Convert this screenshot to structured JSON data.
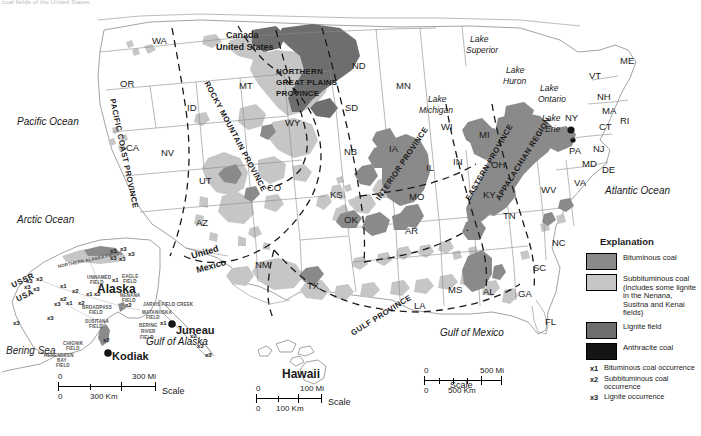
{
  "caption": "coal fields of the United States.",
  "colors": {
    "bituminous": "#8a8a8a",
    "subbituminous": "#c6c6c6",
    "lignite": "#6e6e6e",
    "anthracite": "#151515",
    "outline": "#707070",
    "province_dash": "#1a1a1a"
  },
  "legend": {
    "title": "Explanation",
    "swatches": [
      {
        "label": "Bituminous coal",
        "color": "#8a8a8a"
      },
      {
        "label": "Subbituminous coal (includes some lignite in the Nenana, Susitna and Kenai fields)",
        "color": "#c6c6c6"
      },
      {
        "label": "Lignite field",
        "color": "#6e6e6e"
      },
      {
        "label": "Anthracite coal",
        "color": "#151515"
      }
    ],
    "occurrences": [
      {
        "key": "x1",
        "label": "Bituminous coal occurrence"
      },
      {
        "key": "x2",
        "label": "Subbituminous coal occurrence"
      },
      {
        "key": "x3",
        "label": "Lignite occurrence"
      }
    ]
  },
  "provinces": [
    "PACIFIC COAST PROVINCE",
    "ROCKY MOUNTAIN PROVINCE",
    "NORTHERN GREAT PLAINS PROVINCE",
    "INTERIOR PROVINCE",
    "EASTERN PROVINCE",
    "APPALACHIAN REGION",
    "GULF PROVINCE"
  ],
  "province_labels": {
    "pacific_coast": "PACIFIC COAST PROVINCE",
    "rocky_mountain": "ROCKY MOUNTAIN PROVINCE",
    "northern_great_plains_1": "NORTHERN",
    "northern_great_plains_2": "GREAT PLAINS",
    "northern_great_plains_3": "PROVINCE",
    "interior": "INTERIOR PROVINCE",
    "eastern": "EASTERN PROVINCE",
    "appalachian": "APPALACHIAN REGION",
    "gulf": "GULF PROVINCE"
  },
  "states": [
    {
      "abbr": "WA",
      "x": 152,
      "y": 36
    },
    {
      "abbr": "OR",
      "x": 120,
      "y": 79
    },
    {
      "abbr": "ID",
      "x": 187,
      "y": 103
    },
    {
      "abbr": "MT",
      "x": 239,
      "y": 81
    },
    {
      "abbr": "ND",
      "x": 352,
      "y": 61
    },
    {
      "abbr": "SD",
      "x": 345,
      "y": 103
    },
    {
      "abbr": "MN",
      "x": 396,
      "y": 81
    },
    {
      "abbr": "WI",
      "x": 441,
      "y": 122
    },
    {
      "abbr": "MI",
      "x": 479,
      "y": 130
    },
    {
      "abbr": "NV",
      "x": 161,
      "y": 148
    },
    {
      "abbr": "CA",
      "x": 126,
      "y": 143
    },
    {
      "abbr": "UT",
      "x": 199,
      "y": 176
    },
    {
      "abbr": "WY",
      "x": 285,
      "y": 118
    },
    {
      "abbr": "CO",
      "x": 267,
      "y": 183
    },
    {
      "abbr": "NB",
      "x": 344,
      "y": 147
    },
    {
      "abbr": "KS",
      "x": 330,
      "y": 190
    },
    {
      "abbr": "IA",
      "x": 389,
      "y": 144
    },
    {
      "abbr": "IL",
      "x": 426,
      "y": 163
    },
    {
      "abbr": "MO",
      "x": 409,
      "y": 192
    },
    {
      "abbr": "IN",
      "x": 453,
      "y": 157
    },
    {
      "abbr": "OH",
      "x": 491,
      "y": 160
    },
    {
      "abbr": "KY",
      "x": 483,
      "y": 190
    },
    {
      "abbr": "TN",
      "x": 503,
      "y": 211
    },
    {
      "abbr": "AZ",
      "x": 196,
      "y": 218
    },
    {
      "abbr": "NM",
      "x": 255,
      "y": 260
    },
    {
      "abbr": "OK",
      "x": 344,
      "y": 215
    },
    {
      "abbr": "TX",
      "x": 307,
      "y": 281
    },
    {
      "abbr": "AR",
      "x": 405,
      "y": 226
    },
    {
      "abbr": "MS",
      "x": 448,
      "y": 285
    },
    {
      "abbr": "LA",
      "x": 414,
      "y": 301
    },
    {
      "abbr": "AL",
      "x": 483,
      "y": 287
    },
    {
      "abbr": "GA",
      "x": 518,
      "y": 289
    },
    {
      "abbr": "FL",
      "x": 545,
      "y": 317
    },
    {
      "abbr": "SC",
      "x": 533,
      "y": 263
    },
    {
      "abbr": "NC",
      "x": 552,
      "y": 238
    },
    {
      "abbr": "VA",
      "x": 574,
      "y": 178
    },
    {
      "abbr": "WV",
      "x": 541,
      "y": 185
    },
    {
      "abbr": "MD",
      "x": 582,
      "y": 159
    },
    {
      "abbr": "DE",
      "x": 602,
      "y": 165
    },
    {
      "abbr": "NJ",
      "x": 593,
      "y": 144
    },
    {
      "abbr": "PA",
      "x": 569,
      "y": 146
    },
    {
      "abbr": "NY",
      "x": 565,
      "y": 113
    },
    {
      "abbr": "CT",
      "x": 599,
      "y": 122
    },
    {
      "abbr": "RI",
      "x": 620,
      "y": 116
    },
    {
      "abbr": "MA",
      "x": 602,
      "y": 106
    },
    {
      "abbr": "NH",
      "x": 597,
      "y": 92
    },
    {
      "abbr": "VT",
      "x": 589,
      "y": 71
    },
    {
      "abbr": "ME",
      "x": 620,
      "y": 56
    }
  ],
  "oceans": [
    {
      "name": "Pacific Ocean",
      "x": 17,
      "y": 117
    },
    {
      "name": "Atlantic Ocean",
      "x": 605,
      "y": 186
    },
    {
      "name": "Arctic Ocean",
      "x": 17,
      "y": 215
    },
    {
      "name": "Gulf of Mexico",
      "x": 440,
      "y": 328
    },
    {
      "name": "Gulf of Alaska",
      "x": 146,
      "y": 337
    },
    {
      "name": "Bering Sea",
      "x": 6,
      "y": 346
    }
  ],
  "lakes": [
    {
      "name": "Lake",
      "x": 470,
      "y": 35
    },
    {
      "name": "Superior",
      "x": 466,
      "y": 46
    },
    {
      "name": "Lake",
      "x": 506,
      "y": 66
    },
    {
      "name": "Huron",
      "x": 503,
      "y": 77
    },
    {
      "name": "Lake",
      "x": 428,
      "y": 95
    },
    {
      "name": "Michigan",
      "x": 419,
      "y": 106
    },
    {
      "name": "Lake",
      "x": 540,
      "y": 84
    },
    {
      "name": "Ontario",
      "x": 538,
      "y": 95
    },
    {
      "name": "Lake",
      "x": 542,
      "y": 114
    },
    {
      "name": "Erie",
      "x": 545,
      "y": 125
    }
  ],
  "borders": [
    {
      "name": "Canada",
      "x": 226,
      "y": 31
    },
    {
      "name": "United States",
      "x": 216,
      "y": 43
    },
    {
      "name": "United",
      "x": 191,
      "y": 248
    },
    {
      "name": "Mexico",
      "x": 196,
      "y": 262
    },
    {
      "name": "USSR",
      "x": 11,
      "y": 277
    },
    {
      "name": "USA",
      "x": 16,
      "y": 292
    }
  ],
  "places": [
    {
      "name": "Alaska",
      "x": 97,
      "y": 283
    },
    {
      "name": "Hawaii",
      "x": 282,
      "y": 368
    },
    {
      "name": "Juneau",
      "x": 176,
      "y": 325
    },
    {
      "name": "Kodiak",
      "x": 112,
      "y": 351
    }
  ],
  "alaska_fields": [
    {
      "name": "NORTHERN ALASKA FIELDS",
      "x": 58,
      "y": 265,
      "rot": -12
    },
    {
      "name": "UNNAMED",
      "x": 87,
      "y": 276,
      "rot": 0
    },
    {
      "name": "FIELD",
      "x": 90,
      "y": 281,
      "rot": 0
    },
    {
      "name": "EAGLE",
      "x": 122,
      "y": 275,
      "rot": 0
    },
    {
      "name": "FIELD",
      "x": 123,
      "y": 280,
      "rot": 0
    },
    {
      "name": "NENANA",
      "x": 120,
      "y": 294,
      "rot": 0
    },
    {
      "name": "FIELD",
      "x": 122,
      "y": 299,
      "rot": 0
    },
    {
      "name": "JARVIS FIELD CREEK",
      "x": 143,
      "y": 303,
      "rot": 0
    },
    {
      "name": "MATANUSKA",
      "x": 142,
      "y": 311,
      "rot": 0
    },
    {
      "name": "FIELD",
      "x": 146,
      "y": 316,
      "rot": 0
    },
    {
      "name": "BROADPASS",
      "x": 82,
      "y": 306,
      "rot": 0
    },
    {
      "name": "FIELD",
      "x": 89,
      "y": 311,
      "rot": 0
    },
    {
      "name": "SUSITANA",
      "x": 85,
      "y": 320,
      "rot": 0
    },
    {
      "name": "FIELD",
      "x": 89,
      "y": 325,
      "rot": 0
    },
    {
      "name": "BERING",
      "x": 139,
      "y": 324,
      "rot": 0
    },
    {
      "name": "RIVER",
      "x": 141,
      "y": 330,
      "rot": 0
    },
    {
      "name": "FIELD",
      "x": 140,
      "y": 336,
      "rot": 0
    },
    {
      "name": "CHIGNIK",
      "x": 63,
      "y": 342,
      "rot": 0
    },
    {
      "name": "FIELD",
      "x": 66,
      "y": 347,
      "rot": 0
    },
    {
      "name": "HERENDEEN",
      "x": 44,
      "y": 354,
      "rot": 0
    },
    {
      "name": "BAY",
      "x": 57,
      "y": 359,
      "rot": 0
    },
    {
      "name": "FIELD",
      "x": 56,
      "y": 364,
      "rot": 0
    }
  ],
  "occurrence_markers": [
    {
      "key": "x3",
      "x": 110,
      "y": 248
    },
    {
      "key": "x3",
      "x": 120,
      "y": 246
    },
    {
      "key": "x3",
      "x": 128,
      "y": 251
    },
    {
      "key": "x3",
      "x": 110,
      "y": 255
    },
    {
      "key": "x3",
      "x": 119,
      "y": 256
    },
    {
      "key": "x3",
      "x": 26,
      "y": 278
    },
    {
      "key": "x3",
      "x": 36,
      "y": 276
    },
    {
      "key": "x3",
      "x": 24,
      "y": 284
    },
    {
      "key": "x3",
      "x": 33,
      "y": 286
    },
    {
      "key": "x1",
      "x": 112,
      "y": 277
    },
    {
      "key": "x1",
      "x": 60,
      "y": 283
    },
    {
      "key": "x2",
      "x": 72,
      "y": 288
    },
    {
      "key": "x2",
      "x": 60,
      "y": 296
    },
    {
      "key": "x1",
      "x": 86,
      "y": 291
    },
    {
      "key": "x2",
      "x": 94,
      "y": 291
    },
    {
      "key": "x3",
      "x": 54,
      "y": 301
    },
    {
      "key": "x1",
      "x": 66,
      "y": 300
    },
    {
      "key": "x2",
      "x": 78,
      "y": 300
    },
    {
      "key": "x2",
      "x": 125,
      "y": 302
    },
    {
      "key": "x3",
      "x": 47,
      "y": 315
    },
    {
      "key": "x3",
      "x": 13,
      "y": 320
    },
    {
      "key": "x2",
      "x": 103,
      "y": 337
    },
    {
      "key": "x1",
      "x": 160,
      "y": 320
    },
    {
      "key": "x2",
      "x": 190,
      "y": 333
    },
    {
      "key": "x3",
      "x": 197,
      "y": 343
    },
    {
      "key": "x3",
      "x": 205,
      "y": 352
    }
  ],
  "scales": [
    {
      "id": "alaska-scale",
      "mi_label": "300 Mi",
      "km_label": "300 Km",
      "zero": "0",
      "scale_word": "Scale"
    },
    {
      "id": "hawaii-scale",
      "mi_label": "100 Mi",
      "km_label": "100 Km",
      "zero": "0",
      "scale_word": "Scale"
    },
    {
      "id": "main-scale",
      "mi_label": "500 Mi",
      "km_label": "500 Km",
      "zero": "0",
      "scale_word": "Scale"
    }
  ]
}
